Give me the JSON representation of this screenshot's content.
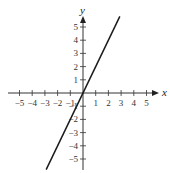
{
  "chart_data": {
    "type": "line",
    "title": "",
    "xlabel": "x",
    "ylabel": "y",
    "xlim": [
      -5.5,
      5.5
    ],
    "ylim": [
      -6,
      6
    ],
    "grid": false,
    "x_ticks": [
      -5,
      -4,
      -3,
      -2,
      -1,
      1,
      2,
      3,
      4,
      5
    ],
    "y_ticks": [
      -5,
      -4,
      -3,
      -2,
      -1,
      1,
      2,
      3,
      4,
      5
    ],
    "x_tick_labels": [
      "−5",
      "−4",
      "−3",
      "−2",
      "−1",
      "1",
      "2",
      "3",
      "4",
      "5"
    ],
    "y_tick_labels": [
      "−5",
      "−4",
      "−3",
      "−2",
      "−1",
      "1",
      "2",
      "3",
      "4",
      "5"
    ],
    "series": [
      {
        "name": "y = 2x",
        "x": [
          -2.9,
          2.9
        ],
        "y": [
          -5.8,
          5.8
        ],
        "color": "#1a1a1a"
      }
    ]
  }
}
